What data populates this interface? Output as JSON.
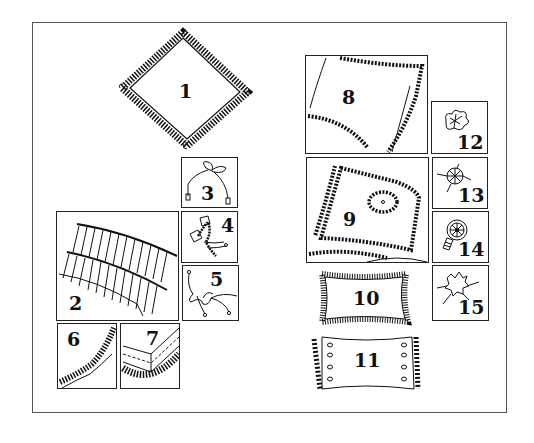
{
  "figure": {
    "kind": "pillow-trim illustration plate",
    "colors": {
      "ink": "#111111",
      "frame": "#555555",
      "background": "#ffffff"
    },
    "items": [
      {
        "id": 1,
        "label": "1",
        "description": "diamond-shaped ruffled pillow"
      },
      {
        "id": 2,
        "label": "2",
        "description": "double row of looped ruffle trim"
      },
      {
        "id": 3,
        "label": "3",
        "description": "cord tied in a bow with tassel ends"
      },
      {
        "id": 4,
        "label": "4",
        "description": "twisted cord knot"
      },
      {
        "id": 5,
        "label": "5",
        "description": "loose cord bow with knotted ends"
      },
      {
        "id": 6,
        "label": "6",
        "description": "gathered ruffle edging"
      },
      {
        "id": 7,
        "label": "7",
        "description": "mitered corner with ruffle trim"
      },
      {
        "id": 8,
        "label": "8",
        "description": "pillow with beaded piping edge"
      },
      {
        "id": 9,
        "label": "9",
        "description": "pillow with double beaded border and beaded oval motif"
      },
      {
        "id": 10,
        "label": "10",
        "description": "rectangular pillow with fringe edge"
      },
      {
        "id": 11,
        "label": "11",
        "description": "rectangular pillow with button rows and gathered ends"
      },
      {
        "id": 12,
        "label": "12",
        "description": "ribbon rosette"
      },
      {
        "id": 13,
        "label": "13",
        "description": "pleated rosette with stitching"
      },
      {
        "id": 14,
        "label": "14",
        "description": "spoked medallion button"
      },
      {
        "id": 15,
        "label": "15",
        "description": "crinkled fabric flower"
      }
    ]
  }
}
